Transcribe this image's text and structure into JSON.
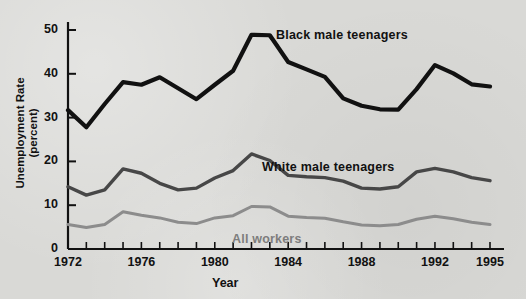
{
  "figure": {
    "background_color": "#d9d9d6",
    "axis_color": "#111111"
  },
  "axes": {
    "ylabel_line1": "Unemployment Rate",
    "ylabel_line2": "(percent)",
    "xlabel": "Year",
    "y_ticks": [
      "0",
      "10",
      "20",
      "30",
      "40",
      "50"
    ],
    "x_ticks": [
      "1972",
      "1976",
      "1980",
      "1984",
      "1988",
      "1992",
      "1995"
    ]
  },
  "annotations": {
    "black": "Black male teenagers",
    "white": "White male teenagers",
    "all": "All workers"
  },
  "chart_data": {
    "type": "line",
    "title": "",
    "xlabel": "Year",
    "ylabel": "Unemployment Rate (percent)",
    "xlim": [
      1972,
      1995
    ],
    "ylim": [
      0,
      52
    ],
    "grid": false,
    "legend": "inline-annotations",
    "x": [
      1972,
      1973,
      1974,
      1975,
      1976,
      1977,
      1978,
      1979,
      1980,
      1981,
      1982,
      1983,
      1984,
      1985,
      1986,
      1987,
      1988,
      1989,
      1990,
      1991,
      1992,
      1993,
      1994,
      1995
    ],
    "series": [
      {
        "name": "Black male teenagers",
        "color": "#111111",
        "values": [
          31.7,
          27.8,
          33.1,
          38.1,
          37.5,
          39.2,
          36.7,
          34.2,
          37.5,
          40.7,
          48.9,
          48.8,
          42.7,
          41.0,
          39.3,
          34.4,
          32.7,
          31.9,
          31.8,
          36.5,
          42.0,
          40.1,
          37.6,
          37.1
        ]
      },
      {
        "name": "White male teenagers",
        "color": "#474747",
        "values": [
          14.2,
          12.3,
          13.5,
          18.3,
          17.3,
          15.0,
          13.5,
          13.9,
          16.2,
          17.9,
          21.7,
          20.2,
          16.8,
          16.5,
          16.3,
          15.5,
          13.9,
          13.7,
          14.2,
          17.6,
          18.4,
          17.6,
          16.3,
          15.6
        ]
      },
      {
        "name": "All workers",
        "color": "#8c8c8c",
        "values": [
          5.6,
          4.9,
          5.6,
          8.5,
          7.7,
          7.1,
          6.1,
          5.8,
          7.1,
          7.6,
          9.7,
          9.6,
          7.5,
          7.2,
          7.0,
          6.2,
          5.5,
          5.3,
          5.6,
          6.8,
          7.5,
          6.9,
          6.1,
          5.6
        ]
      }
    ]
  }
}
